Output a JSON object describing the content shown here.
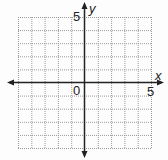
{
  "chart_data": {
    "type": "scatter",
    "title": "",
    "xlabel": "x",
    "ylabel": "y",
    "xlim": [
      -5,
      5
    ],
    "ylim": [
      -5,
      5
    ],
    "grid": true,
    "grid_step": 1,
    "tick_labels": {
      "origin": "0",
      "x_max": "5",
      "y_max": "5"
    },
    "series": []
  },
  "labels": {
    "x_axis": "x",
    "y_axis": "y",
    "origin": "0",
    "x_tick_5": "5",
    "y_tick_5": "5"
  },
  "colors": {
    "axis": "#222222",
    "grid": "#9a9a9a",
    "background": "#fdfdfd"
  }
}
